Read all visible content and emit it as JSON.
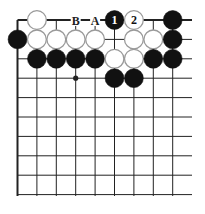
{
  "diagram": {
    "type": "go-board-fragment",
    "grid": {
      "x0": 17.5,
      "y0": 20,
      "spacing": 19.4,
      "columns": 9,
      "rows": 10,
      "h_line_right": 192,
      "v_line_bottom": 196,
      "left_edge_bold": true,
      "top_edge_bold": true
    },
    "colors": {
      "line": "#222222",
      "black_stone": "#111111",
      "white_stone_fill": "#ffffff",
      "white_stone_stroke": "#9a9a9a",
      "background": "#ffffff"
    },
    "star_points": [
      {
        "col": 3,
        "row": 3
      }
    ],
    "stones": [
      {
        "col": 1,
        "row": 0,
        "color": "white"
      },
      {
        "col": 5,
        "row": 0,
        "color": "black",
        "label": "1"
      },
      {
        "col": 6,
        "row": 0,
        "color": "white",
        "label": "2"
      },
      {
        "col": 8,
        "row": 0,
        "color": "black"
      },
      {
        "col": 0,
        "row": 1,
        "color": "black"
      },
      {
        "col": 1,
        "row": 1,
        "color": "white"
      },
      {
        "col": 2,
        "row": 1,
        "color": "white"
      },
      {
        "col": 3,
        "row": 1,
        "color": "white"
      },
      {
        "col": 4,
        "row": 1,
        "color": "white"
      },
      {
        "col": 6,
        "row": 1,
        "color": "white"
      },
      {
        "col": 7,
        "row": 1,
        "color": "white"
      },
      {
        "col": 8,
        "row": 1,
        "color": "black"
      },
      {
        "col": 1,
        "row": 2,
        "color": "black"
      },
      {
        "col": 2,
        "row": 2,
        "color": "black"
      },
      {
        "col": 3,
        "row": 2,
        "color": "black"
      },
      {
        "col": 4,
        "row": 2,
        "color": "black"
      },
      {
        "col": 5,
        "row": 2,
        "color": "white"
      },
      {
        "col": 6,
        "row": 2,
        "color": "white"
      },
      {
        "col": 7,
        "row": 2,
        "color": "black"
      },
      {
        "col": 8,
        "row": 2,
        "color": "black"
      },
      {
        "col": 5,
        "row": 3,
        "color": "black"
      },
      {
        "col": 6,
        "row": 3,
        "color": "black"
      }
    ],
    "point_labels": [
      {
        "col": 3,
        "row": 0,
        "text": "B"
      },
      {
        "col": 4,
        "row": 0,
        "text": "A"
      }
    ]
  }
}
